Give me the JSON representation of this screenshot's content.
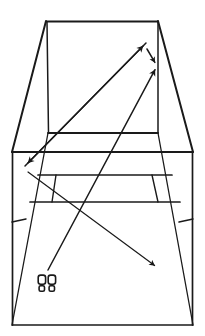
{
  "image": {
    "title": "Perspective line drawing of room interior with direction arrows",
    "width": 205,
    "height": 336,
    "background_color": "#ffffff",
    "ink_color": "#1a1a1a",
    "line_style": "hand-drawn ink line art, no fill"
  },
  "scene": {
    "description": "Single-point perspective sketch of an interior space (room or corridor) seen from a standing viewpoint, annotated with four arrows and a pair of footprints marking the observer position.",
    "elements_count": 4
  },
  "geometry": {
    "outer_frame": {
      "name": "outer-wall-outline",
      "points": "12,152 12,325 193,325 193,152",
      "note": "near wall / picture border, vertical sides"
    },
    "back_wall": {
      "name": "back-wall-rectangle",
      "points": "46,21 158,21 158,133 48,133",
      "note": "far wall of the room, upper rectangle"
    },
    "ceiling_left_edge": {
      "name": "ceiling-left-receding-edge",
      "points": "46,21 12,152"
    },
    "ceiling_right_edge": {
      "name": "ceiling-right-receding-edge",
      "points": "158,21 193,152"
    },
    "floor_left_edge": {
      "name": "floor-left-receding-edge",
      "points": "48,133 12,325"
    },
    "floor_right_edge": {
      "name": "floor-right-receding-edge",
      "points": "158,133 193,325"
    },
    "horizontals": [
      {
        "name": "back-wall-base-line",
        "points": "48,133 158,133"
      },
      {
        "name": "wall-floor-junction-line",
        "points": "12,152 193,152"
      },
      {
        "name": "step-upper-line",
        "points": "38,175 172,175"
      },
      {
        "name": "step-lower-line",
        "points": "30,202 180,202"
      }
    ],
    "verticals": [
      {
        "name": "step-riser-left",
        "points": "56,175 52,202"
      },
      {
        "name": "step-riser-right",
        "points": "152,175 158,202"
      }
    ],
    "tick_marks": [
      {
        "name": "left-wall-tick",
        "points": "12,222 26,219"
      },
      {
        "name": "right-wall-tick",
        "points": "193,219 179,222"
      }
    ]
  },
  "annotations": {
    "arrows": [
      {
        "id": "arrow-1",
        "name": "arrow-up-right-to-back-wall",
        "label": "long arrow from lower-left toward upper-right back wall",
        "from": [
          25,
          166
        ],
        "to": [
          146,
          43
        ],
        "head_at": "to",
        "direction": "up-right",
        "style": "solid filled triangular head"
      },
      {
        "id": "arrow-2",
        "name": "arrow-down-right-short-link",
        "label": "short connecting arrow between the two upper arrowheads",
        "from": [
          147,
          49
        ],
        "to": [
          157,
          66
        ],
        "head_at": "to",
        "direction": "down-right",
        "style": "solid filled triangular head"
      },
      {
        "id": "arrow-3",
        "name": "arrow-from-footprints-up-right",
        "label": "arrow rising from footprint marker to upper-right",
        "from": [
          48,
          270
        ],
        "to": [
          157,
          66
        ],
        "head_at": "to",
        "direction": "up-right",
        "style": "solid filled triangular head"
      },
      {
        "id": "arrow-4",
        "name": "arrow-down-left-to-near-wall",
        "label": "long arrow descending left from the upper right area to the left wall",
        "from": [
          146,
          43
        ],
        "to": [
          25,
          166
        ],
        "head_at": "to",
        "direction": "down-left",
        "style": "solid filled triangular head"
      },
      {
        "id": "arrow-5",
        "name": "arrow-down-right-to-floor",
        "label": "long arrow descending right across the floor",
        "from": [
          28,
          172
        ],
        "to": [
          158,
          268
        ],
        "head_at": "to",
        "direction": "down-right",
        "style": "solid filled triangular head"
      }
    ],
    "markers": [
      {
        "id": "marker-1",
        "name": "footprints-marker",
        "label": "pair of footprints indicating observer standing position",
        "position": [
          46,
          287
        ],
        "glyph": "footprints"
      }
    ]
  }
}
